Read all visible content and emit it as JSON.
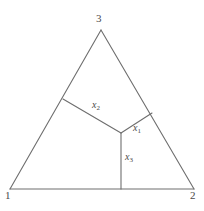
{
  "figure": {
    "type": "geometric-diagram",
    "background_color": "#ffffff",
    "line_color": "#6e6e6e",
    "text_color": "#4a4a4a",
    "line_width": 1
  },
  "geometry": {
    "triangle": {
      "vertices": [
        {
          "id": "v1",
          "label": "1",
          "x": 10,
          "y": 189
        },
        {
          "id": "v2",
          "label": "2",
          "x": 194,
          "y": 189
        },
        {
          "id": "v3",
          "label": "3",
          "x": 101,
          "y": 30
        }
      ],
      "edges": [
        {
          "from": "v1",
          "to": "v2",
          "name": "base-edge"
        },
        {
          "from": "v1",
          "to": "v3",
          "name": "left-edge"
        },
        {
          "from": "v2",
          "to": "v3",
          "name": "right-edge"
        }
      ]
    },
    "junction": {
      "id": "j",
      "x": 121,
      "y": 133
    },
    "branches": [
      {
        "id": "x1",
        "label": "x",
        "subscript": "1",
        "from": "j",
        "to": {
          "x": 152,
          "y": 113
        },
        "meets": "right-edge"
      },
      {
        "id": "x2",
        "label": "x",
        "subscript": "2",
        "from": "j",
        "to": {
          "x": 63,
          "y": 99
        },
        "meets": "left-edge"
      },
      {
        "id": "x3",
        "label": "x",
        "subscript": "3",
        "from": "j",
        "to": {
          "x": 121,
          "y": 189
        },
        "meets": "base-edge"
      }
    ]
  },
  "labels": {
    "vertex_1": "1",
    "vertex_2": "2",
    "vertex_3": "3",
    "branch_x1_base": "x",
    "branch_x1_sub": "1",
    "branch_x2_base": "x",
    "branch_x2_sub": "2",
    "branch_x3_base": "x",
    "branch_x3_sub": "3"
  }
}
